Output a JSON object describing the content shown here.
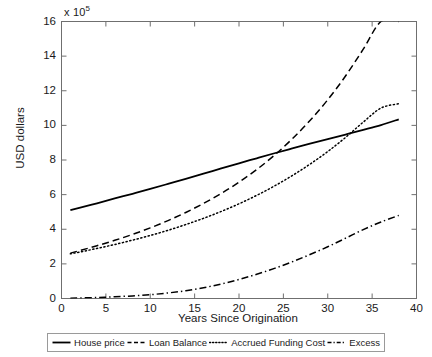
{
  "chart_data": {
    "type": "line",
    "title": "",
    "xlabel": "Years Since Origination",
    "ylabel": "USD dollars",
    "y_multiplier": "x 10",
    "y_multiplier_exponent": "5",
    "xlim": [
      0,
      40
    ],
    "ylim": [
      0,
      16
    ],
    "xticks": [
      0,
      5,
      10,
      15,
      20,
      25,
      30,
      35,
      40
    ],
    "yticks": [
      0,
      2,
      4,
      6,
      8,
      10,
      12,
      14,
      16
    ],
    "grid": false,
    "legend_position": "below-axes",
    "x": [
      1,
      2,
      4,
      6,
      8,
      10,
      12,
      14,
      16,
      18,
      20,
      22,
      24,
      26,
      28,
      30,
      32,
      34,
      36,
      38
    ],
    "series": [
      {
        "name": "House price",
        "style": "solid",
        "color": "#000000",
        "values": [
          5.1,
          5.23,
          5.5,
          5.78,
          6.05,
          6.33,
          6.62,
          6.91,
          7.21,
          7.51,
          7.81,
          8.1,
          8.39,
          8.67,
          8.94,
          9.21,
          9.47,
          9.74,
          10.02,
          10.35
        ]
      },
      {
        "name": "Loan Balance",
        "style": "dashed",
        "color": "#000000",
        "values": [
          2.62,
          2.76,
          3.05,
          3.36,
          3.7,
          4.08,
          4.5,
          4.97,
          5.49,
          6.07,
          6.72,
          7.45,
          8.28,
          9.22,
          10.28,
          11.48,
          12.85,
          14.4,
          16.0,
          16.0
        ]
      },
      {
        "name": "Accrued Funding Cost",
        "style": "dotted",
        "color": "#000000",
        "values": [
          2.58,
          2.68,
          2.89,
          3.12,
          3.37,
          3.64,
          3.94,
          4.27,
          4.63,
          5.03,
          5.47,
          5.96,
          6.5,
          7.1,
          7.76,
          8.49,
          9.3,
          10.19,
          11.0,
          11.25
        ]
      },
      {
        "name": "Excess",
        "style": "dashdot",
        "color": "#000000",
        "values": [
          0.02,
          0.03,
          0.06,
          0.1,
          0.15,
          0.22,
          0.32,
          0.45,
          0.62,
          0.84,
          1.1,
          1.4,
          1.74,
          2.12,
          2.54,
          2.99,
          3.48,
          3.98,
          4.42,
          4.8
        ]
      }
    ]
  },
  "legend": {
    "items": [
      {
        "label": "House price",
        "style": "solid"
      },
      {
        "label": "Loan Balance",
        "style": "dashed"
      },
      {
        "label": "Accrued Funding Cost",
        "style": "dotted"
      },
      {
        "label": "Excess",
        "style": "dashdot"
      }
    ]
  }
}
